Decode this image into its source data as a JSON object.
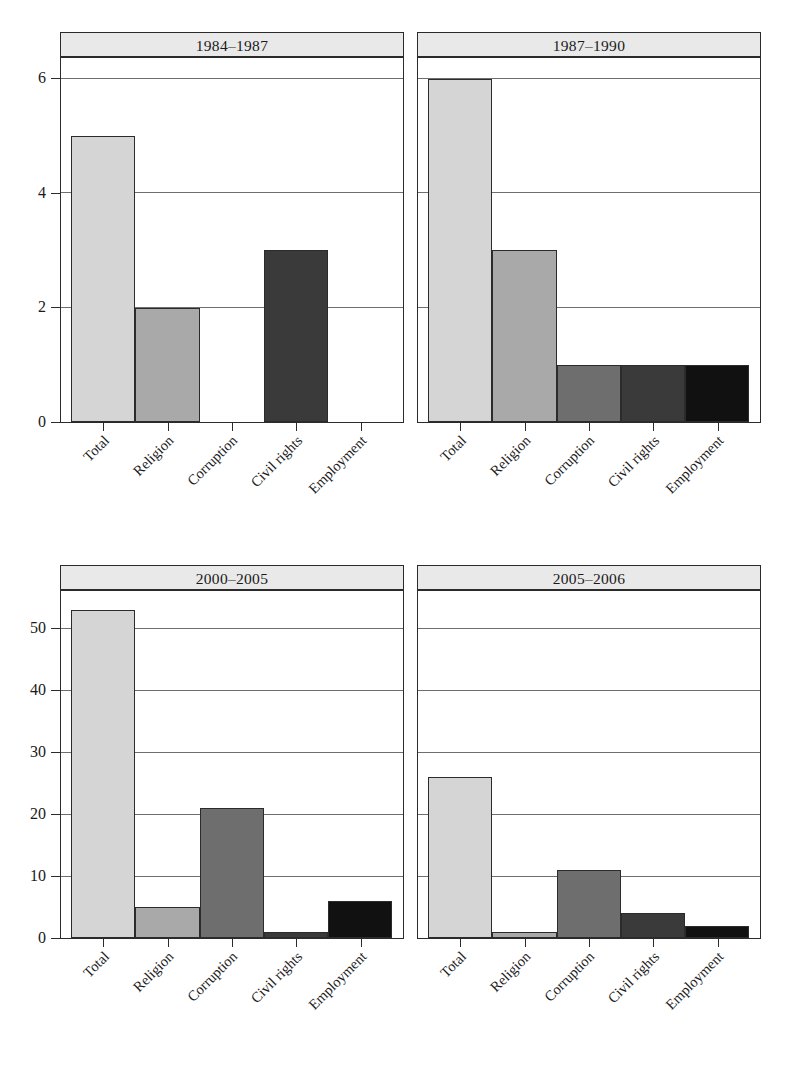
{
  "chart_data": {
    "type": "bar",
    "title": "",
    "xlabel": "",
    "ylabel": "",
    "grid": true,
    "legend": "none",
    "layout": "2x2 small multiples (trellis / faceted bar panels)",
    "categories": [
      "Total",
      "Religion",
      "Corruption",
      "Civil rights",
      "Employment"
    ],
    "bar_colors": [
      "#d5d5d5",
      "#a9a9a9",
      "#6e6e6e",
      "#3a3a3a",
      "#111111"
    ],
    "panels": [
      {
        "label": "1984–1987",
        "values": [
          5,
          2,
          0,
          3,
          0
        ],
        "ylim": [
          0,
          6.35
        ],
        "yticks": [
          0,
          2,
          4,
          6
        ],
        "ytick_labels": [
          "0",
          "2",
          "4",
          "6"
        ]
      },
      {
        "label": "1987–1990",
        "values": [
          6,
          3,
          1,
          1,
          1
        ],
        "ylim": [
          0,
          6.35
        ],
        "yticks": [
          0,
          2,
          4,
          6
        ],
        "ytick_labels": [
          "0",
          "2",
          "4",
          "6"
        ]
      },
      {
        "label": "2000–2005",
        "values": [
          53,
          5,
          21,
          1,
          6
        ],
        "ylim": [
          0,
          56
        ],
        "yticks": [
          0,
          10,
          20,
          30,
          40,
          50
        ],
        "ytick_labels": [
          "0",
          "10",
          "20",
          "30",
          "40",
          "50"
        ]
      },
      {
        "label": "2005–2006",
        "values": [
          26,
          1,
          11,
          4,
          2
        ],
        "ylim": [
          0,
          56
        ],
        "yticks": [
          0,
          10,
          20,
          30,
          40,
          50
        ],
        "ytick_labels": [
          "0",
          "10",
          "20",
          "30",
          "40",
          "50"
        ]
      }
    ]
  },
  "panel_titles": {
    "p0": "1984–1987",
    "p1": "1987–1990",
    "p2": "2000–2005",
    "p3": "2005–2006"
  }
}
